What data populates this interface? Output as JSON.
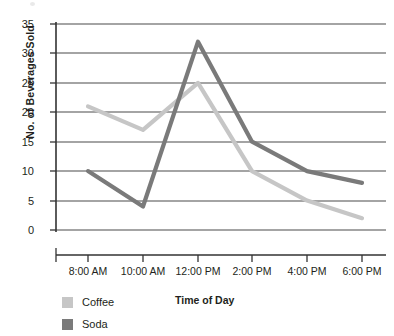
{
  "chart_data": {
    "type": "line",
    "title": "",
    "xlabel": "Time of Day",
    "ylabel": "No. of Beverages Sold",
    "categories": [
      "8:00 AM",
      "10:00 AM",
      "12:00 PM",
      "2:00 PM",
      "4:00 PM",
      "6:00 PM"
    ],
    "series": [
      {
        "name": "Coffee",
        "values": [
          21,
          17,
          25,
          10,
          5,
          2
        ],
        "color": "#c6c6c6"
      },
      {
        "name": "Soda",
        "values": [
          10,
          4,
          32,
          15,
          10,
          8
        ],
        "color": "#7a7a7a"
      }
    ],
    "ylim": [
      0,
      35
    ],
    "yticks": [
      0,
      5,
      10,
      15,
      20,
      25,
      30,
      35
    ],
    "ytick_labels": [
      "0",
      "5",
      "10",
      "15",
      "20",
      "25",
      "30",
      "35"
    ],
    "grid": true,
    "grid_axis": "y",
    "legend_position": "bottom-left",
    "axis_color": "#3a3a3a",
    "grid_color": "#4a4a4a"
  },
  "axes": {
    "y_title": "No. of Beverages Sold",
    "x_title": "Time of Day"
  },
  "legend": {
    "items": [
      {
        "label": "Coffee",
        "color": "#c6c6c6"
      },
      {
        "label": "Soda",
        "color": "#7a7a7a"
      }
    ]
  }
}
